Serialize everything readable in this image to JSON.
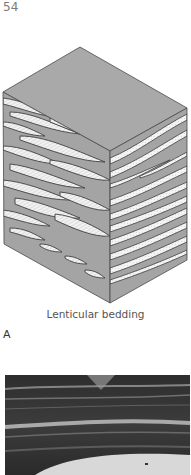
{
  "page": {
    "number": "54"
  },
  "figure": {
    "caption": "Lenticular bedding",
    "panel_label": "A",
    "diagram": {
      "type": "block-diagram",
      "subject": "lenticular bedding",
      "colors": {
        "top_face": "#a9a9a9",
        "mud_layer": "#a4a4a4",
        "sand_lens": "#f2f2f2",
        "outline": "#4a4a4a"
      }
    },
    "photo": {
      "description": "core photograph showing lenticular bedding",
      "colors": {
        "dark": "#2e2e2e",
        "light_band": "#bdbdbd",
        "base_sand": "#d8d8d8"
      }
    }
  }
}
